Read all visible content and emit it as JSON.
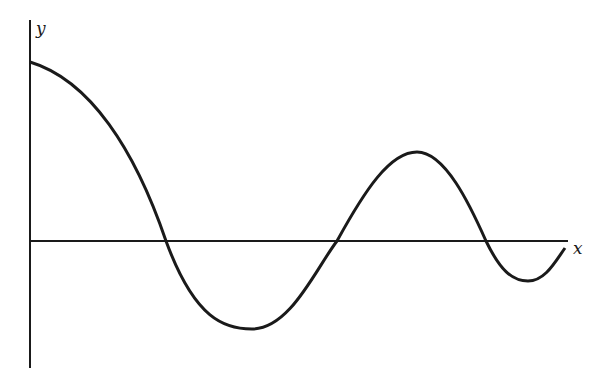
{
  "diagram": {
    "type": "damped-oscillation-curve",
    "axes": {
      "x_label": "x",
      "y_label": "y"
    },
    "curve": {
      "description": "Damped oscillation starting at maximum on the y-axis, crossing the x-axis three times",
      "points": [
        [
          30,
          62
        ],
        [
          166,
          241
        ],
        [
          252,
          329
        ],
        [
          337,
          241
        ],
        [
          417,
          152
        ],
        [
          486,
          241
        ],
        [
          528,
          281
        ],
        [
          565,
          248
        ]
      ]
    },
    "colors": {
      "stroke": "#1a1a1a",
      "background": "#ffffff"
    }
  }
}
